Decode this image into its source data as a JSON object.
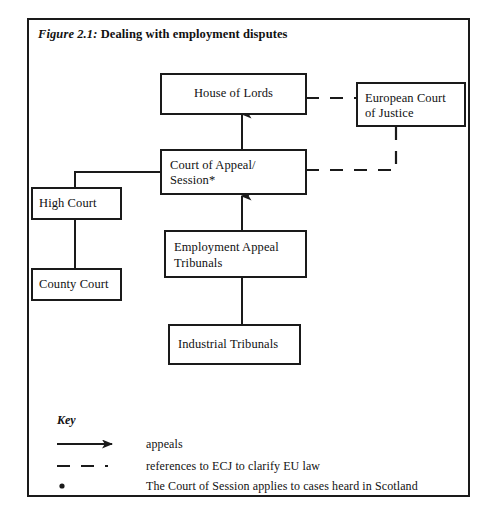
{
  "figure": {
    "label": "Figure 2.1:",
    "title": "Dealing with employment disputes"
  },
  "nodes": {
    "house_of_lords": "House of Lords",
    "european_court_line1": "European Court",
    "european_court_line2": "of Justice",
    "court_of_appeal_line1": "Court of Appeal/",
    "court_of_appeal_line2": "Session*",
    "high_court": "High Court",
    "county_court": "County Court",
    "employment_appeal_line1": "Employment Appeal",
    "employment_appeal_line2": "Tribunals",
    "industrial_tribunals": "Industrial Tribunals"
  },
  "key": {
    "heading": "Key",
    "items": [
      {
        "marker": "solid-arrow",
        "label": "appeals"
      },
      {
        "marker": "dashed-line",
        "label": "references to ECJ to clarify EU law"
      },
      {
        "marker": "asterisk-dot",
        "label": "The Court of Session applies to cases heard in Scotland"
      }
    ]
  },
  "colors": {
    "line": "#1a1a1a",
    "text": "#111111",
    "background": "#ffffff"
  }
}
